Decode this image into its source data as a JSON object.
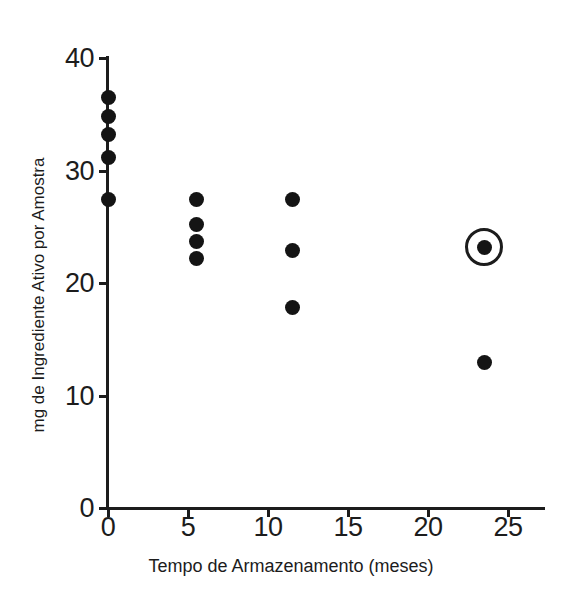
{
  "chart_data": {
    "type": "scatter",
    "title": "",
    "xlabel": "Tempo de Armazenamento (meses)",
    "ylabel": "mg de Ingrediente Ativo por Amostra",
    "xlim": [
      0,
      27
    ],
    "ylim": [
      0,
      40
    ],
    "xticks": [
      0,
      5,
      10,
      15,
      20,
      25
    ],
    "xtick_labels": [
      "0",
      "5",
      "10",
      "15",
      "20",
      "25"
    ],
    "yticks": [
      0,
      10,
      20,
      30,
      40
    ],
    "ytick_labels": [
      "0",
      "10",
      "20",
      "30",
      "40"
    ],
    "grid": false,
    "legend": null,
    "marker": "filled-circle",
    "marker_color": "#141414",
    "axis_color": "#1c1c1c",
    "background_color": "#ffffff",
    "points": [
      {
        "x": 0,
        "y": 36.5,
        "highlighted": false
      },
      {
        "x": 0,
        "y": 34.8,
        "highlighted": false
      },
      {
        "x": 0,
        "y": 33.2,
        "highlighted": false
      },
      {
        "x": 0,
        "y": 31.2,
        "highlighted": false
      },
      {
        "x": 0,
        "y": 27.4,
        "highlighted": false
      },
      {
        "x": 5.5,
        "y": 27.4,
        "highlighted": false
      },
      {
        "x": 5.5,
        "y": 25.2,
        "highlighted": false
      },
      {
        "x": 5.5,
        "y": 23.7,
        "highlighted": false
      },
      {
        "x": 5.5,
        "y": 22.2,
        "highlighted": false
      },
      {
        "x": 11.5,
        "y": 27.4,
        "highlighted": false
      },
      {
        "x": 11.5,
        "y": 22.9,
        "highlighted": false
      },
      {
        "x": 11.5,
        "y": 17.8,
        "highlighted": false
      },
      {
        "x": 23.5,
        "y": 23.2,
        "highlighted": true
      },
      {
        "x": 23.5,
        "y": 12.9,
        "highlighted": false
      }
    ],
    "annotations": [
      {
        "type": "circle-highlight",
        "x": 23.5,
        "y": 23.2,
        "radius_units": 2.3,
        "color": "#1c1c1c"
      }
    ]
  }
}
